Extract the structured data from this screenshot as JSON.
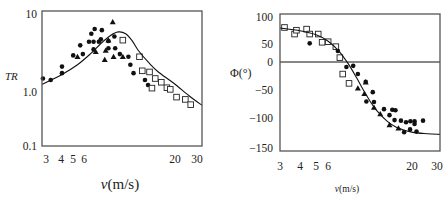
{
  "chart_data": [
    {
      "type": "scatter",
      "title": "",
      "xlabel": "v(m/s)",
      "ylabel": "TR",
      "xscale": "log",
      "yscale": "log",
      "xlim": [
        3,
        30
      ],
      "ylim": [
        0.1,
        10
      ],
      "grid": false,
      "legend": "none",
      "xticks": [
        "3",
        "4",
        "5",
        "6",
        "20",
        "30"
      ],
      "yticks": [
        "10",
        "1.0",
        "0.1"
      ],
      "fit_curve": {
        "name": "model",
        "style": "solid-line",
        "x": [
          3,
          4,
          5,
          6,
          7,
          8,
          9,
          10,
          11,
          12,
          14,
          16,
          20,
          25,
          30
        ],
        "y": [
          0.82,
          1.15,
          1.6,
          2.3,
          3.3,
          4.3,
          4.9,
          4.6,
          3.6,
          2.6,
          1.7,
          1.25,
          0.85,
          0.55,
          0.4
        ]
      },
      "series": [
        {
          "name": "circles",
          "marker": "filled-circle",
          "x": [
            3.04,
            3.4,
            4.0,
            4.0,
            4.7,
            5.2,
            5.4,
            5.9,
            6.1,
            6.3,
            6.3,
            6.4,
            6.8,
            7.1,
            7.0,
            7.8,
            7.8,
            8.5,
            8.6,
            9.2,
            10.4,
            10.7,
            11.2,
            13.2,
            13.8
          ],
          "y": [
            1.0,
            0.95,
            1.5,
            1.2,
            2.2,
            3.1,
            2.3,
            3.5,
            4.6,
            2.7,
            3.5,
            5.4,
            3.5,
            5.2,
            3.8,
            3.6,
            2.8,
            4.2,
            2.8,
            2.3,
            2.1,
            1.6,
            1.2,
            0.95,
            0.8
          ]
        },
        {
          "name": "triangles",
          "marker": "filled-triangle",
          "x": [
            8.3,
            5.0,
            6.5,
            7.5,
            7.4,
            7.8,
            8.4,
            9.6
          ],
          "y": [
            6.9,
            2.1,
            2.5,
            2.6,
            1.9,
            3.7,
            2.1,
            2.1
          ]
        },
        {
          "name": "squares",
          "marker": "open-square",
          "x": [
            9.6,
            12.2,
            12.7,
            14.1,
            14.6,
            15.3,
            16.7,
            18.1,
            19.0,
            20.8,
            23.6,
            25.5
          ],
          "y": [
            3.7,
            2.1,
            1.3,
            1.25,
            0.72,
            1.0,
            0.88,
            0.73,
            0.69,
            0.53,
            0.49,
            0.41
          ]
        }
      ]
    },
    {
      "type": "scatter",
      "title": "",
      "xlabel": "v(m/s)",
      "ylabel": "Φ(°)",
      "xscale": "log",
      "yscale": "linear",
      "xlim": [
        3,
        30
      ],
      "ylim": [
        -150,
        100
      ],
      "grid": false,
      "legend": "none",
      "reference_line": {
        "y": 0
      },
      "xticks": [
        "3",
        "4",
        "5",
        "6",
        "20",
        "30"
      ],
      "yticks": [
        "100",
        "50",
        "0",
        "−50",
        "−100",
        "−150"
      ],
      "fit_curve": {
        "name": "model",
        "style": "solid-line",
        "x": [
          3,
          4,
          5,
          6,
          7,
          8,
          9,
          10,
          11,
          12,
          14,
          16,
          20,
          25,
          30
        ],
        "y": [
          62,
          57,
          50,
          38,
          20,
          -3,
          -28,
          -52,
          -72,
          -88,
          -108,
          -119,
          -128,
          -131,
          -132
        ]
      },
      "series": [
        {
          "name": "squares",
          "marker": "open-square",
          "x": [
            3.2,
            3.7,
            3.8,
            4.4,
            4.6,
            5.2,
            5.5,
            6.0,
            6.7,
            7.1,
            7.4,
            8.1
          ],
          "y": [
            63,
            51,
            58,
            60,
            51,
            51,
            36,
            37,
            28,
            8,
            -22,
            -39
          ]
        },
        {
          "name": "circles",
          "marker": "filled-circle",
          "x": [
            4.6,
            6.9,
            7.8,
            8.6,
            9.2,
            10.3,
            11.4,
            10.4,
            11.6,
            13.4,
            15.1,
            15.8,
            14.5,
            15.6,
            17.1,
            18.4,
            19.6,
            20.8,
            23.5,
            17.9,
            19.5,
            21.4,
            20.8
          ],
          "y": [
            34,
            20,
            -9,
            -7,
            -22,
            -36,
            -55,
            -72,
            -73,
            -86,
            -87,
            -88,
            -97,
            -106,
            -107,
            -110,
            -108,
            -108,
            -107,
            -128,
            -123,
            -127,
            -113
          ]
        },
        {
          "name": "triangles",
          "marker": "filled-triangle",
          "x": [
            10.3,
            9.2,
            10.1,
            11.6,
            12.7,
            14.5,
            16.5
          ],
          "y": [
            -37,
            -48,
            -58,
            -83,
            -95,
            -115,
            -121
          ]
        }
      ]
    }
  ]
}
